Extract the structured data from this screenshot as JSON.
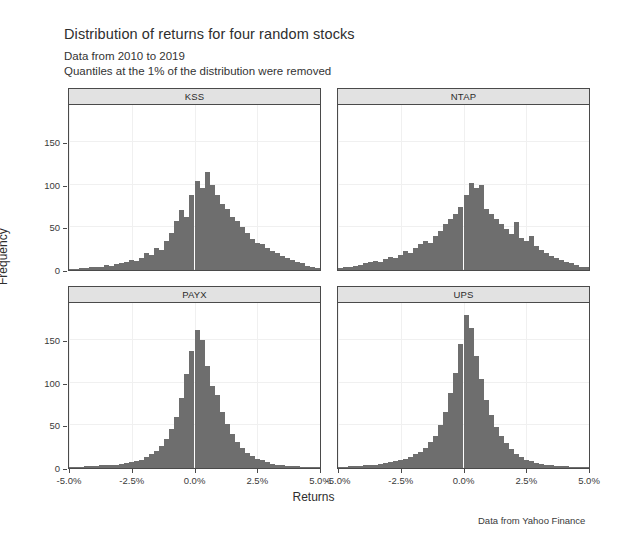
{
  "figure": {
    "title": "Distribution of returns for four random stocks",
    "subtitle_line1": "Data from 2010 to 2019",
    "subtitle_line2": "Quantiles at the 1% of the distribution were removed",
    "caption": "Data from Yahoo Finance"
  },
  "axes": {
    "xlabel": "Returns",
    "ylabel": "Frequency",
    "ytick_labels": [
      "0",
      "50",
      "100",
      "150"
    ],
    "xtick_labels": [
      "-5.0%",
      "-2.5%",
      "0.0%",
      "2.5%",
      "5.0%"
    ]
  },
  "chart_data": {
    "type": "bar",
    "title": "Distribution of returns for four random stocks",
    "subtitle": "Data from 2010 to 2019 / Quantiles at the 1% of the distribution were removed",
    "xlabel": "Returns",
    "ylabel": "Frequency",
    "annotation": "Data from Yahoo Finance",
    "layout": "2x2 faceted histogram grid",
    "grid": true,
    "legend": "none",
    "xlim": [
      -5.0,
      5.0
    ],
    "ylim": [
      0,
      195
    ],
    "xtick_values": [
      -5.0,
      -2.5,
      0.0,
      2.5,
      5.0
    ],
    "xtick_labels": [
      "-5.0%",
      "-2.5%",
      "0.0%",
      "2.5%",
      "5.0%"
    ],
    "ytick_values": [
      0,
      50,
      100,
      150
    ],
    "ytick_labels": [
      "0",
      "50",
      "100",
      "150"
    ],
    "bin_width": 0.2,
    "bin_centers": [
      -4.9,
      -4.7,
      -4.5,
      -4.3,
      -4.1,
      -3.9,
      -3.7,
      -3.5,
      -3.3,
      -3.1,
      -2.9,
      -2.7,
      -2.5,
      -2.3,
      -2.1,
      -1.9,
      -1.7,
      -1.5,
      -1.3,
      -1.1,
      -0.9,
      -0.7,
      -0.5,
      -0.3,
      -0.1,
      0.1,
      0.3,
      0.5,
      0.7,
      0.9,
      1.1,
      1.3,
      1.5,
      1.7,
      1.9,
      2.1,
      2.3,
      2.5,
      2.7,
      2.9,
      3.1,
      3.3,
      3.5,
      3.7,
      3.9,
      4.1,
      4.3,
      4.5,
      4.7,
      4.9
    ],
    "bar_color": "#6e6e6e",
    "panels": [
      {
        "label": "KSS",
        "position": "top-left",
        "peak": 115,
        "values": [
          1,
          1,
          2,
          2,
          3,
          4,
          4,
          6,
          5,
          7,
          8,
          10,
          12,
          11,
          14,
          20,
          18,
          26,
          24,
          34,
          44,
          57,
          70,
          62,
          88,
          105,
          96,
          115,
          100,
          88,
          78,
          72,
          62,
          58,
          50,
          44,
          36,
          32,
          30,
          26,
          22,
          20,
          16,
          14,
          12,
          10,
          8,
          5,
          3,
          2
        ]
      },
      {
        "label": "NTAP",
        "position": "top-right",
        "peak": 102,
        "values": [
          2,
          3,
          4,
          5,
          6,
          8,
          9,
          11,
          10,
          13,
          15,
          14,
          18,
          22,
          20,
          26,
          30,
          34,
          32,
          40,
          46,
          54,
          60,
          66,
          74,
          88,
          102,
          96,
          100,
          72,
          66,
          60,
          54,
          48,
          42,
          56,
          38,
          34,
          40,
          28,
          24,
          20,
          17,
          14,
          12,
          10,
          8,
          6,
          4,
          3
        ]
      },
      {
        "label": "PAYX",
        "position": "bottom-left",
        "peak": 162,
        "values": [
          1,
          1,
          1,
          2,
          2,
          2,
          3,
          3,
          4,
          4,
          5,
          6,
          7,
          8,
          10,
          13,
          16,
          20,
          26,
          34,
          46,
          60,
          82,
          110,
          138,
          162,
          150,
          120,
          96,
          86,
          66,
          52,
          40,
          30,
          24,
          18,
          14,
          11,
          9,
          7,
          5,
          4,
          3,
          2,
          2,
          2,
          1,
          1,
          1,
          1
        ]
      },
      {
        "label": "UPS",
        "position": "bottom-right",
        "peak": 180,
        "values": [
          1,
          1,
          2,
          2,
          2,
          3,
          3,
          4,
          5,
          6,
          7,
          8,
          9,
          11,
          13,
          16,
          19,
          24,
          30,
          38,
          50,
          66,
          88,
          112,
          146,
          180,
          165,
          132,
          104,
          80,
          62,
          48,
          38,
          29,
          22,
          17,
          13,
          10,
          8,
          6,
          5,
          4,
          3,
          2,
          2,
          2,
          1,
          1,
          1,
          1
        ]
      }
    ]
  }
}
